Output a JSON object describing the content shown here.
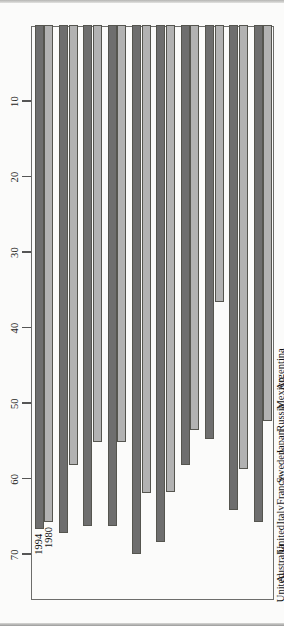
{
  "chart_data": {
    "type": "bar",
    "orientation": "rotated-horizontal",
    "title": "",
    "xlabel": "",
    "ylabel": "",
    "grid": false,
    "axis_ticks": [
      70,
      60,
      50,
      40,
      30,
      20,
      10
    ],
    "value_range": [
      0,
      76
    ],
    "categories": [
      "United\nStates",
      "Australia",
      "United\nKingdom",
      "Italy",
      "France",
      "Sweden",
      "Japan",
      "Russia",
      "Mexico",
      "Argentina"
    ],
    "series": [
      {
        "name": "1980",
        "color": "#b2b2b2",
        "values": [
          65.8,
          58.2,
          55.2,
          55.2,
          62.0,
          61.8,
          53.6,
          36.7,
          58.8,
          52.4
        ]
      },
      {
        "name": "1994",
        "color": "#6e6e6e",
        "values": [
          66.7,
          67.3,
          66.4,
          66.4,
          70.0,
          68.5,
          58.2,
          54.8,
          64.2,
          65.8
        ]
      }
    ],
    "legend_position": "in-plot-first-group",
    "annotations": [
      {
        "label": "1994",
        "series": "1994",
        "category": "United States"
      },
      {
        "label": "1980",
        "series": "1980",
        "category": "United States"
      }
    ]
  },
  "axis": {
    "tick_labels": [
      "70",
      "60",
      "50",
      "40",
      "30",
      "20",
      "10"
    ]
  },
  "colors": {
    "series_1994": "#6e6e6e",
    "series_1980": "#b2b2b2",
    "frame": "#6d6d6b",
    "plot_background": "#fbfbfa",
    "page_background": "#ffffff"
  }
}
